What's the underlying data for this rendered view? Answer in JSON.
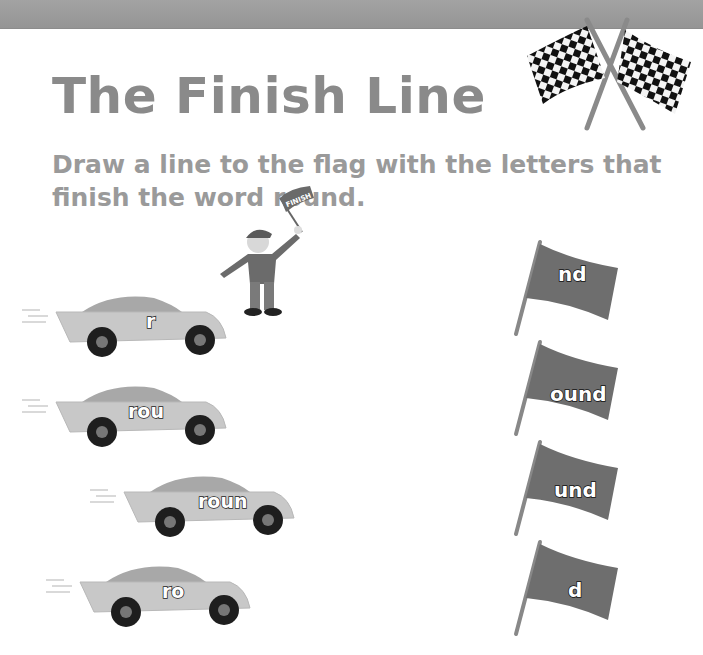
{
  "page": {
    "title": "The Finish Line",
    "instructions": "Draw a line to the flag with the letters that finish the word round.",
    "target_word": "round",
    "colors": {
      "banner": "#9a9a9a",
      "title": "#8a8a8a",
      "instructions": "#9a9a9a",
      "car_body": "#c4c4c4",
      "flag": "#6e6e6e"
    }
  },
  "flagman": {
    "flag_text": "FINISH"
  },
  "cars": [
    {
      "label": "r"
    },
    {
      "label": "rou"
    },
    {
      "label": "roun"
    },
    {
      "label": "ro"
    }
  ],
  "flags": [
    {
      "label": "nd"
    },
    {
      "label": "ound"
    },
    {
      "label": "und"
    },
    {
      "label": "d"
    }
  ],
  "icons": {
    "checkered_flags": "crossed-checkered-flags-icon",
    "flagman": "flagman-figure",
    "car": "race-car-icon",
    "flag": "pennant-flag-icon"
  }
}
